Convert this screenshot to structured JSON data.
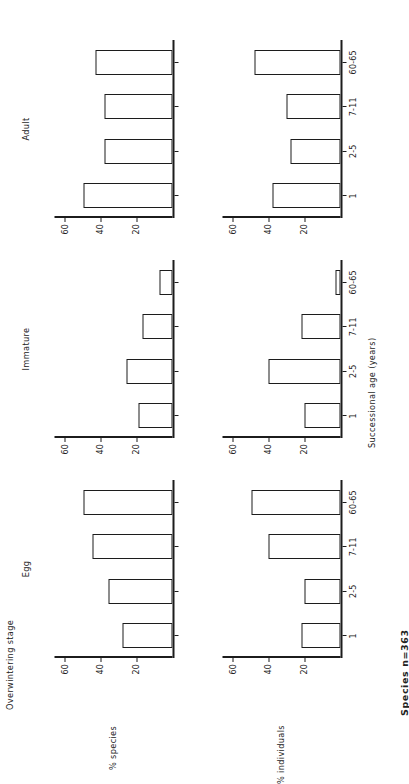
{
  "figure": {
    "title": "Overwintering stage",
    "footnote": "Species n=363",
    "x_axis_title": "Successional age (years)",
    "categories": [
      "1",
      "2-5",
      "7-11",
      "60-65"
    ],
    "y_ticks": [
      "20",
      "40",
      "60"
    ],
    "y_max": 66,
    "column_titles": [
      "Egg",
      "Immature",
      "Adult"
    ],
    "row_titles": [
      "% species",
      "% individuals"
    ]
  },
  "chart_data": [
    {
      "type": "bar",
      "title": "Egg",
      "xlabel": "Successional age (years)",
      "ylabel": "% species",
      "categories": [
        "1",
        "2-5",
        "7-11",
        "60-65"
      ],
      "values": [
        28,
        36,
        45,
        50
      ],
      "ylim": [
        0,
        66
      ],
      "yticks": [
        20,
        40,
        60
      ],
      "grid": false,
      "legend": "none"
    },
    {
      "type": "bar",
      "title": "Immature",
      "xlabel": "Successional age (years)",
      "ylabel": "% species",
      "categories": [
        "1",
        "2-5",
        "7-11",
        "60-65"
      ],
      "values": [
        19,
        26,
        17,
        7
      ],
      "ylim": [
        0,
        66
      ],
      "yticks": [
        20,
        40,
        60
      ],
      "grid": false,
      "legend": "none"
    },
    {
      "type": "bar",
      "title": "Adult",
      "xlabel": "Successional age (years)",
      "ylabel": "% species",
      "categories": [
        "1",
        "2-5",
        "7-11",
        "60-65"
      ],
      "values": [
        50,
        38,
        38,
        43
      ],
      "ylim": [
        0,
        66
      ],
      "yticks": [
        20,
        40,
        60
      ],
      "grid": false,
      "legend": "none"
    },
    {
      "type": "bar",
      "title": "Egg",
      "xlabel": "Successional age (years)",
      "ylabel": "% individuals",
      "categories": [
        "1",
        "2-5",
        "7-11",
        "60-65"
      ],
      "values": [
        22,
        20,
        40,
        50
      ],
      "ylim": [
        0,
        66
      ],
      "yticks": [
        20,
        40,
        60
      ],
      "grid": false,
      "legend": "none"
    },
    {
      "type": "bar",
      "title": "Immature",
      "xlabel": "Successional age (years)",
      "ylabel": "% individuals",
      "categories": [
        "1",
        "2-5",
        "7-11",
        "60-65"
      ],
      "values": [
        20,
        40,
        22,
        3
      ],
      "ylim": [
        0,
        66
      ],
      "yticks": [
        20,
        40,
        60
      ],
      "grid": false,
      "legend": "none"
    },
    {
      "type": "bar",
      "title": "Adult",
      "xlabel": "Successional age (years)",
      "ylabel": "% individuals",
      "categories": [
        "1",
        "2-5",
        "7-11",
        "60-65"
      ],
      "values": [
        38,
        28,
        30,
        48
      ],
      "ylim": [
        0,
        66
      ],
      "yticks": [
        20,
        40,
        60
      ],
      "grid": false,
      "legend": "none"
    }
  ]
}
